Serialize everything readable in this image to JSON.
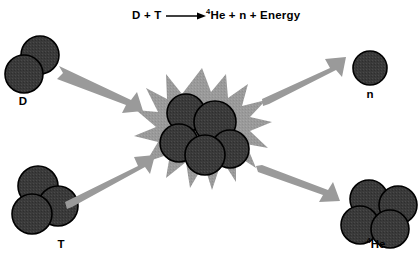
{
  "figure": {
    "title_equation": {
      "reactants": "D + T",
      "arrow": "⟶",
      "products_prefix": "4",
      "products": "He + n + Energy"
    },
    "background_color": "#ffffff",
    "particle_color": "#3a3a3a",
    "particle_outline_color": "#000000",
    "burst_color": "#9a9a9a",
    "arrow_color": "#9a9a9a",
    "text_color": "#000000"
  },
  "reactants": [
    {
      "id": "deuterium",
      "label": "D",
      "label_sup": "",
      "nucleon_count": 2,
      "description": "deuterium nucleus: 1 proton + 1 neutron"
    },
    {
      "id": "tritium",
      "label": "T",
      "label_sup": "",
      "nucleon_count": 3,
      "description": "tritium nucleus: 1 proton + 2 neutrons"
    }
  ],
  "products": [
    {
      "id": "neutron",
      "label": "n",
      "label_sup": "",
      "nucleon_count": 1,
      "description": "free neutron"
    },
    {
      "id": "helium4",
      "label": "He",
      "label_sup": "4",
      "nucleon_count": 4,
      "description": "helium-4 nucleus: 2 protons + 2 neutrons"
    }
  ],
  "fusion_site": {
    "id": "fusion-burst",
    "nucleon_count": 5,
    "description": "energetic collision / compound nucleus"
  },
  "arrows": [
    {
      "id": "arrow-d-in",
      "direction": "down-right",
      "role": "deuterium enters collision"
    },
    {
      "id": "arrow-t-in",
      "direction": "up-right",
      "role": "tritium enters collision"
    },
    {
      "id": "arrow-n-out",
      "direction": "up-right",
      "role": "neutron ejected"
    },
    {
      "id": "arrow-he-out",
      "direction": "down-right",
      "role": "helium-4 ejected"
    }
  ]
}
